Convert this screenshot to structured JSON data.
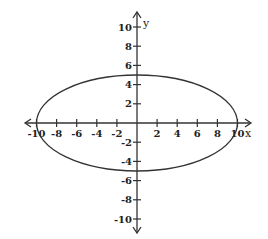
{
  "chart_data": {
    "type": "line",
    "title": "",
    "xlabel": "x",
    "ylabel": "y",
    "xlim": [
      -11,
      11
    ],
    "ylim": [
      -11,
      11
    ],
    "grid": false,
    "x_ticks": [
      -10,
      -8,
      -6,
      -4,
      -2,
      2,
      4,
      6,
      8,
      10
    ],
    "y_ticks": [
      10,
      8,
      6,
      4,
      2,
      -2,
      -4,
      -6,
      -8,
      -10
    ],
    "x_tick_labels": [
      "-10",
      "-8",
      "-6",
      "-4",
      "-2",
      "2",
      "4",
      "6",
      "8",
      "10"
    ],
    "y_tick_labels": [
      "10",
      "8",
      "6",
      "4",
      "2",
      "-2",
      "-4",
      "-6",
      "-8",
      "-10"
    ],
    "series": [
      {
        "name": "ellipse",
        "shape": "ellipse",
        "center": [
          0,
          0
        ],
        "semi_major_x": 10,
        "semi_minor_y": 5,
        "equation": "x^2/100 + y^2/25 = 1",
        "points": [
          [
            -10,
            0
          ],
          [
            0,
            5
          ],
          [
            10,
            0
          ],
          [
            0,
            -5
          ]
        ]
      }
    ],
    "colors": {
      "curve": "#333333",
      "axes": "#333333",
      "background": "#ffffff"
    }
  },
  "axes": {
    "x_label": "x",
    "y_label": "y"
  }
}
